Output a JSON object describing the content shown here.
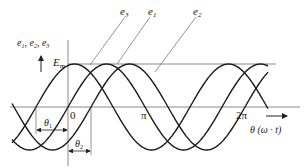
{
  "diagram": {
    "y_axis_label": "e1, e2, e3",
    "y_axis_label_parts": [
      "e",
      "1",
      ", ",
      "e",
      "2",
      ", ",
      "e",
      "3"
    ],
    "amplitude_label": "E",
    "amplitude_label_sub": "m",
    "x_axis_label": "θ (ω · t)",
    "tick_labels": {
      "origin": "0",
      "pi": "π",
      "two_pi": "2π"
    },
    "angle_labels": {
      "theta1": "θ",
      "theta1_sub": "1",
      "theta2": "θ",
      "theta2_sub": "2"
    },
    "curves": [
      {
        "name": "e3",
        "label": "e",
        "sub": "3",
        "zero_cross_x": 36
      },
      {
        "name": "e1",
        "label": "e",
        "sub": "1",
        "zero_cross_x": 68
      },
      {
        "name": "e2",
        "label": "e",
        "sub": "2",
        "zero_cross_x": 91
      }
    ],
    "geometry": {
      "axis_y": 107,
      "origin_x": 68,
      "amplitude_px": 43,
      "period_px": 154,
      "x_start": 12,
      "x_end": 268
    },
    "colors": {
      "curve": "#1a1a1a",
      "axis": "#8a8a8a",
      "text": "#222222"
    }
  }
}
